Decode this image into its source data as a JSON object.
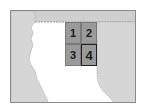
{
  "map": {
    "colors": {
      "land_shaded": "#d6d6d6",
      "top_band": "#cfcfcf",
      "grid_fill": "#9a9a9a",
      "frame": "#8a8a8a",
      "background": "#ffffff"
    },
    "grid": {
      "cells": [
        {
          "label": "1",
          "highlighted": false
        },
        {
          "label": "2",
          "highlighted": false
        },
        {
          "label": "3",
          "highlighted": false
        },
        {
          "label": "4",
          "highlighted": true
        }
      ]
    }
  }
}
